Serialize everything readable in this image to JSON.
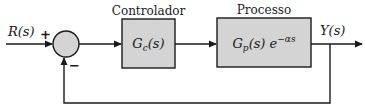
{
  "diagram": {
    "type": "closed-loop control block diagram",
    "input": {
      "label": "R(s)"
    },
    "output": {
      "label": "Y(s)"
    },
    "summing_junction": {
      "plus_sign": "+",
      "minus_sign": "−"
    },
    "blocks": [
      {
        "id": "controller",
        "title": "Controlador",
        "transfer_function": "Gc(s)",
        "tf_base": "G",
        "tf_sub": "c",
        "tf_arg": "(s)"
      },
      {
        "id": "process",
        "title": "Processo",
        "transfer_function": "Gp(s) e^(−αs)",
        "tf_base": "G",
        "tf_sub": "p",
        "tf_arg": "(s) e",
        "tf_exp": "−αs"
      }
    ],
    "feedback": "unity negative feedback from Y(s) to summing junction",
    "colors": {
      "block_fill": "#d4d4d4",
      "junction_fill": "#d4d4d4",
      "stroke": "#1a1a1a",
      "background": "#ffffff"
    }
  }
}
